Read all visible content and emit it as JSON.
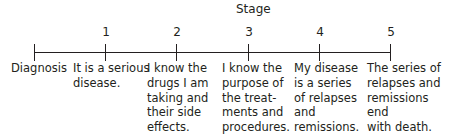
{
  "diagram": {
    "title": "Stage",
    "start_label": "Diagnosis",
    "stages": [
      {
        "number": "1",
        "text": "It is a serious\ndisease."
      },
      {
        "number": "2",
        "text": "I know the\ndrugs I am\ntaking and\ntheir side\neffects."
      },
      {
        "number": "3",
        "text": "I know the\npurpose of\nthe treat-\nments and\nprocedures."
      },
      {
        "number": "4",
        "text": "My disease\nis a series\nof relapses\nand\nremissions."
      },
      {
        "number": "5",
        "text": "The series of\nrelapses and\nremissions end\nwith death."
      }
    ]
  }
}
